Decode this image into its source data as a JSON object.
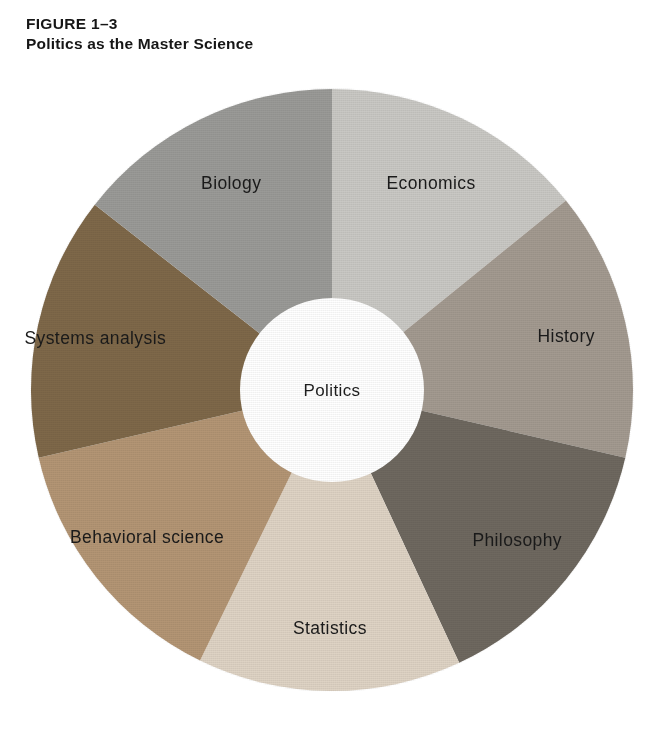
{
  "caption": {
    "figure_number": "FIGURE 1–3",
    "title": "Politics as the Master Science"
  },
  "wheel": {
    "center_label": "Politics",
    "hub_color": "#ffffff",
    "segments": [
      {
        "label": "Economics",
        "color": "#c9c8c4",
        "start_angle": 0,
        "end_angle": 51,
        "label_radius": 0.66,
        "label_angle": 25.5
      },
      {
        "label": "History",
        "color": "#a39a90",
        "start_angle": 51,
        "end_angle": 103,
        "label_radius": 0.71,
        "label_angle": 77
      },
      {
        "label": "Philosophy",
        "color": "#6e685f",
        "start_angle": 103,
        "end_angle": 155,
        "label_radius": 0.7,
        "label_angle": 129
      },
      {
        "label": "Statistics",
        "color": "#ded3c4",
        "start_angle": 155,
        "end_angle": 206,
        "label_radius": 0.7,
        "label_angle": 180.5
      },
      {
        "label": "Behavioral science",
        "color": "#b39574",
        "start_angle": 206,
        "end_angle": 257,
        "label_radius": 0.69,
        "label_angle": 231.5
      },
      {
        "label": "Systems analysis",
        "color": "#7e6849",
        "start_angle": 257,
        "end_angle": 308,
        "label_radius": 0.72,
        "label_angle": 282.5
      },
      {
        "label": "Biology",
        "color": "#9a9a97",
        "start_angle": 308,
        "end_angle": 360,
        "label_radius": 0.66,
        "label_angle": 334
      }
    ]
  },
  "chart_data": {
    "type": "pie",
    "title": "Politics as the Master Science",
    "subtitle": "FIGURE 1–3",
    "center_label": "Politics",
    "categories": [
      "Economics",
      "History",
      "Philosophy",
      "Statistics",
      "Behavioral science",
      "Systems analysis",
      "Biology"
    ],
    "values": [
      51,
      52,
      52,
      51,
      51,
      51,
      52
    ],
    "value_unit": "degrees",
    "colors": [
      "#c9c8c4",
      "#a39a90",
      "#6e685f",
      "#ded3c4",
      "#b39574",
      "#7e6849",
      "#9a9a97"
    ],
    "donut_inner_ratio": 0.305,
    "legend": "none",
    "grid": false
  }
}
